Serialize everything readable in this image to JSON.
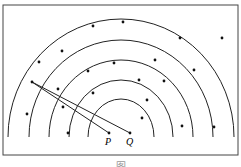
{
  "diagram": {
    "center": {
      "x": 121,
      "y": 137
    },
    "radii": [
      33,
      52,
      72,
      92,
      113
    ],
    "frame": {
      "x": 3,
      "y": 5,
      "w": 235,
      "h": 150
    },
    "stroke_color": "#222222",
    "points": {
      "P": {
        "label": "P",
        "x": 109,
        "y": 133
      },
      "Q": {
        "label": "Q",
        "x": 130,
        "y": 133
      },
      "A": {
        "x": 32,
        "y": 82
      }
    },
    "segments": [
      [
        "A",
        "P"
      ],
      [
        "A",
        "Q"
      ]
    ],
    "dots": [
      [
        93,
        26
      ],
      [
        123,
        22
      ],
      [
        180,
        38
      ],
      [
        222,
        38
      ],
      [
        62,
        51
      ],
      [
        39,
        62
      ],
      [
        114,
        63
      ],
      [
        88,
        71
      ],
      [
        155,
        60
      ],
      [
        194,
        70
      ],
      [
        139,
        80
      ],
      [
        164,
        81
      ],
      [
        58,
        89
      ],
      [
        93,
        93
      ],
      [
        63,
        107
      ],
      [
        147,
        100
      ],
      [
        27,
        114
      ],
      [
        142,
        118
      ],
      [
        68,
        133
      ],
      [
        182,
        126
      ],
      [
        214,
        127
      ]
    ]
  },
  "caption": "图"
}
